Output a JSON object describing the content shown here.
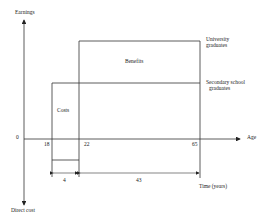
{
  "diagram": {
    "axes": {
      "y_top_label": "Earnings",
      "y_bottom_label": "Direct cost",
      "x_label": "Age",
      "origin_label": "0"
    },
    "ticks": {
      "t18": "18",
      "t22": "22",
      "t65": "65"
    },
    "regions": {
      "costs": "Costs",
      "benefits": "Benefits"
    },
    "series": {
      "university": [
        "University",
        "graduates"
      ],
      "secondary": [
        "Secondary school",
        "graduates"
      ]
    },
    "durations": {
      "study": "4",
      "work": "43",
      "time_label": "Time (years)"
    },
    "colors": {
      "line": "#333333",
      "text": "#222222",
      "background": "#ffffff"
    }
  }
}
